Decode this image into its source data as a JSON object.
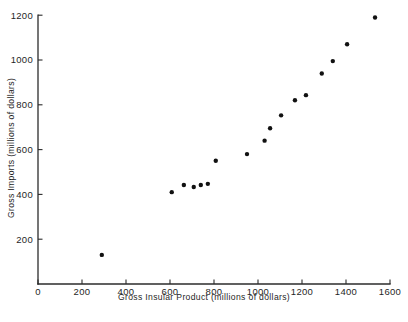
{
  "chart_data": {
    "type": "scatter",
    "title": "",
    "xlabel": "Gross Insular Product (millions of dollars)",
    "ylabel": "Gross Imports (millions of dollars)",
    "xlim": [
      0,
      1600
    ],
    "ylim": [
      0,
      1200
    ],
    "xticks": [
      0,
      200,
      400,
      600,
      800,
      1000,
      1200,
      1400,
      1600
    ],
    "xticklabels": [
      "0",
      "200",
      "400",
      "600",
      "800",
      "1000",
      "1200",
      "1400",
      "1600"
    ],
    "yticks": [
      200,
      400,
      600,
      800,
      1000,
      1200
    ],
    "yticklabels": [
      "200",
      "400",
      "600",
      "800",
      "1000",
      "1200"
    ],
    "grid": false,
    "legend": null,
    "marker": "filled-circle",
    "marker_color": "#111111",
    "points": [
      {
        "x": 290,
        "y": 130
      },
      {
        "x": 608,
        "y": 410
      },
      {
        "x": 663,
        "y": 442
      },
      {
        "x": 708,
        "y": 433
      },
      {
        "x": 740,
        "y": 442
      },
      {
        "x": 772,
        "y": 447
      },
      {
        "x": 808,
        "y": 550
      },
      {
        "x": 950,
        "y": 580
      },
      {
        "x": 1030,
        "y": 640
      },
      {
        "x": 1055,
        "y": 695
      },
      {
        "x": 1105,
        "y": 753
      },
      {
        "x": 1168,
        "y": 820
      },
      {
        "x": 1218,
        "y": 843
      },
      {
        "x": 1290,
        "y": 940
      },
      {
        "x": 1340,
        "y": 995
      },
      {
        "x": 1405,
        "y": 1070
      },
      {
        "x": 1532,
        "y": 1190
      }
    ]
  },
  "axes": {
    "x_title": "Gross Insular Product (millions of dollars)",
    "y_title": "Gross Imports (millions of dollars)"
  }
}
